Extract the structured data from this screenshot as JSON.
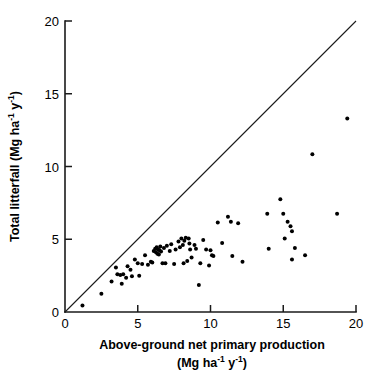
{
  "chart_data": {
    "type": "scatter",
    "title": "",
    "xlabel": "Above-ground net primary production (Mg ha-1 y-1)",
    "ylabel": "Total litterfall (Mg ha-1 y-1)",
    "xlim": [
      0,
      20
    ],
    "ylim": [
      0,
      20
    ],
    "xticks": [
      0,
      5,
      10,
      15,
      20
    ],
    "yticks": [
      0,
      5,
      10,
      15,
      20
    ],
    "xtick_labels": [
      "0",
      "5",
      "10",
      "15",
      "20"
    ],
    "ytick_labels": [
      "0",
      "5",
      "10",
      "15",
      "20"
    ],
    "grid": false,
    "legend": null,
    "marker": "filled-circle",
    "marker_color": "#000000",
    "marker_size_px": 4,
    "reference_line": {
      "name": "1:1 line",
      "from": [
        0,
        0
      ],
      "to": [
        20,
        20
      ],
      "color": "#1a1a1a"
    },
    "series": [
      {
        "name": "Forest sites",
        "points": [
          [
            1.2,
            0.45
          ],
          [
            2.5,
            1.25
          ],
          [
            3.2,
            2.1
          ],
          [
            3.5,
            3.05
          ],
          [
            3.6,
            2.6
          ],
          [
            3.8,
            2.55
          ],
          [
            3.9,
            1.95
          ],
          [
            4.0,
            2.6
          ],
          [
            4.2,
            2.35
          ],
          [
            4.3,
            3.15
          ],
          [
            4.5,
            2.9
          ],
          [
            4.6,
            2.45
          ],
          [
            4.8,
            3.6
          ],
          [
            5.0,
            3.35
          ],
          [
            5.1,
            2.5
          ],
          [
            5.3,
            3.3
          ],
          [
            5.5,
            3.9
          ],
          [
            5.7,
            3.25
          ],
          [
            5.9,
            3.45
          ],
          [
            6.0,
            3.4
          ],
          [
            6.1,
            4.2
          ],
          [
            6.2,
            4.35
          ],
          [
            6.25,
            4.1
          ],
          [
            6.3,
            4.45
          ],
          [
            6.35,
            4.0
          ],
          [
            6.4,
            4.3
          ],
          [
            6.45,
            3.95
          ],
          [
            6.5,
            4.25
          ],
          [
            6.55,
            4.5
          ],
          [
            6.6,
            4.15
          ],
          [
            6.7,
            3.35
          ],
          [
            6.8,
            4.4
          ],
          [
            6.9,
            3.35
          ],
          [
            7.0,
            4.55
          ],
          [
            7.2,
            4.2
          ],
          [
            7.3,
            4.65
          ],
          [
            7.5,
            3.3
          ],
          [
            7.6,
            4.3
          ],
          [
            7.8,
            4.85
          ],
          [
            7.9,
            4.45
          ],
          [
            8.0,
            5.05
          ],
          [
            8.1,
            4.6
          ],
          [
            8.15,
            3.35
          ],
          [
            8.2,
            4.9
          ],
          [
            8.3,
            5.1
          ],
          [
            8.4,
            3.5
          ],
          [
            8.5,
            5.05
          ],
          [
            8.55,
            4.7
          ],
          [
            8.6,
            4.3
          ],
          [
            8.7,
            3.75
          ],
          [
            8.9,
            4.6
          ],
          [
            9.0,
            4.35
          ],
          [
            9.2,
            1.85
          ],
          [
            9.3,
            3.35
          ],
          [
            9.5,
            4.95
          ],
          [
            9.7,
            4.3
          ],
          [
            9.9,
            3.2
          ],
          [
            10.0,
            4.25
          ],
          [
            10.1,
            3.9
          ],
          [
            10.2,
            3.85
          ],
          [
            10.5,
            6.15
          ],
          [
            10.8,
            4.75
          ],
          [
            11.2,
            6.55
          ],
          [
            11.4,
            6.2
          ],
          [
            11.5,
            3.85
          ],
          [
            11.9,
            6.1
          ],
          [
            12.2,
            3.45
          ],
          [
            13.9,
            6.75
          ],
          [
            14.0,
            4.35
          ],
          [
            14.8,
            7.75
          ],
          [
            15.0,
            6.75
          ],
          [
            15.1,
            5.05
          ],
          [
            15.3,
            6.2
          ],
          [
            15.5,
            5.9
          ],
          [
            15.6,
            5.55
          ],
          [
            15.6,
            3.6
          ],
          [
            15.8,
            4.4
          ],
          [
            16.5,
            3.9
          ],
          [
            17.0,
            10.85
          ],
          [
            18.7,
            6.75
          ],
          [
            19.4,
            13.3
          ]
        ]
      }
    ]
  },
  "axes": {
    "x_title_line1": "Above-ground net primary production",
    "x_title_line2_prefix": "(Mg ha",
    "x_title_line2_sup1": "-1",
    "x_title_line2_mid": " y",
    "x_title_line2_sup2": "-1",
    "x_title_line2_suffix": ")",
    "y_title_prefix": "Total litterfall (Mg ha",
    "y_title_sup1": "-1",
    "y_title_mid": " y",
    "y_title_sup2": "-1",
    "y_title_suffix": ")"
  }
}
